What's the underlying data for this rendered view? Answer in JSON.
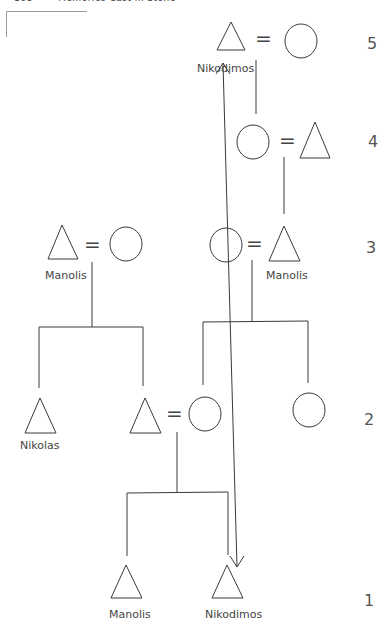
{
  "header": {
    "page_number": "168",
    "running_title": "Memories Cast in Stone"
  },
  "diagram": {
    "type": "kinship-chart",
    "marriage_symbol": "=",
    "generation_labels": [
      "5",
      "4",
      "3",
      "2",
      "1"
    ],
    "names": {
      "gen5_male": "Nikodimos",
      "gen3_left_male": "Manolis",
      "gen3_right_male": "Manolis",
      "gen2_left_male": "Nikolas",
      "gen1_left_male": "Manolis",
      "gen1_right_male": "Nikodimos"
    },
    "symbols": {
      "male": "triangle",
      "female": "circle"
    },
    "annotation": "double-headed arrow linking Nikodimos (generation 1) to Nikodimos (generation 5)"
  }
}
